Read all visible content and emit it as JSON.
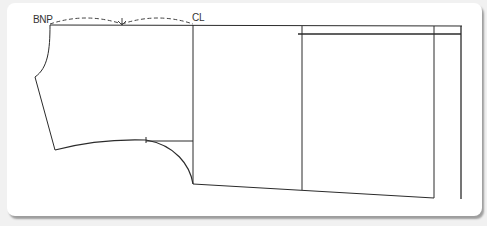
{
  "diagram": {
    "type": "garment-pattern-draft",
    "labels": {
      "bnp": "BNP",
      "cl": "CL"
    },
    "colors": {
      "line": "#2b2b2b",
      "dashed": "#444444",
      "card": "#ffffff",
      "background": "#f1f1f1"
    }
  }
}
